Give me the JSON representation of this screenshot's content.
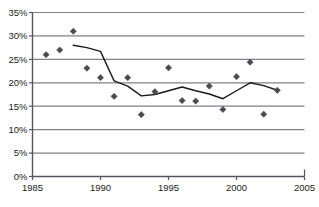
{
  "chart_data": {
    "type": "scatter",
    "title": "",
    "subtitle": "",
    "xlabel": "",
    "ylabel": "",
    "xlim": [
      1985,
      2005
    ],
    "ylim": [
      0,
      35
    ],
    "grid": true,
    "grid_axis": "y",
    "legend": "none",
    "y_tick_labels": [
      "0%",
      "5%",
      "10%",
      "15%",
      "20%",
      "25%",
      "30%",
      "35%"
    ],
    "y_tick_values": [
      0,
      5,
      10,
      15,
      20,
      25,
      30,
      35
    ],
    "x_tick_labels": [
      "1985",
      "1990",
      "1995",
      "2000",
      "2005"
    ],
    "x_tick_values": [
      1985,
      1990,
      1995,
      2000,
      2005
    ],
    "marker": "diamond",
    "marker_color": "#4a4a52",
    "line_color": "#1b1b1b",
    "grid_color": "#808088",
    "axis_color": "#555560",
    "series": [
      {
        "name": "observations",
        "type": "scatter",
        "x": [
          1986,
          1987,
          1988,
          1989,
          1990,
          1991,
          1992,
          1993,
          1994,
          1995,
          1996,
          1997,
          1998,
          1999,
          2000,
          2001,
          2002,
          2003
        ],
        "values": [
          26.0,
          27.0,
          31.0,
          23.1,
          21.1,
          17.1,
          21.1,
          13.2,
          18.1,
          23.2,
          16.2,
          16.1,
          19.3,
          14.3,
          21.3,
          24.4,
          13.3,
          18.4
        ]
      },
      {
        "name": "trend",
        "type": "line",
        "x": [
          1988,
          1989,
          1990,
          1991,
          1992,
          1993,
          1994,
          1995,
          1996,
          1997,
          1998,
          1999,
          2000,
          2001,
          2002,
          2003
        ],
        "values": [
          28.0,
          27.5,
          26.7,
          20.4,
          19.3,
          17.2,
          17.5,
          18.3,
          19.1,
          18.3,
          17.6,
          16.6,
          18.3,
          20.0,
          19.4,
          18.4
        ]
      }
    ]
  }
}
